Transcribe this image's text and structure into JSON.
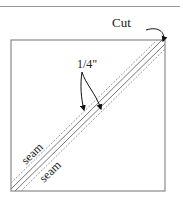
{
  "diagram": {
    "cut_label": "Cut",
    "quarter_inch_label": "1/4\"",
    "seam_label_upper": "seam",
    "seam_label_lower": "seam",
    "colors": {
      "line": "#8a8a8a",
      "dashed": "#9a9a9a",
      "text": "#222222",
      "arrow": "#111111"
    }
  }
}
